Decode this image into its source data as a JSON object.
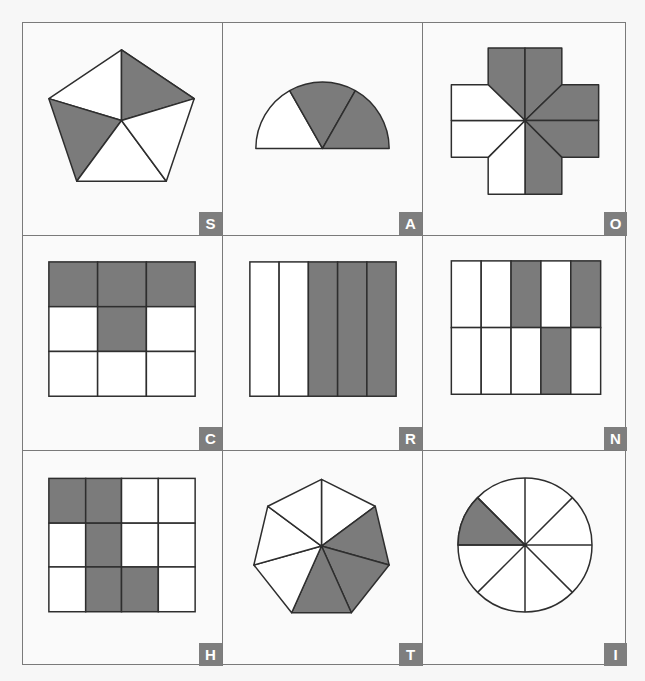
{
  "colors": {
    "shade": "#7b7b7b",
    "stroke": "#2e2e2e",
    "unshaded": "#ffffff",
    "badge_bg": "#7e7e7e",
    "badge_text": "#ffffff",
    "grid_line": "#7a7a7a"
  },
  "puzzle": {
    "cells": [
      {
        "label": "S",
        "shape": "pentagon",
        "divisions": 5,
        "shaded": 2,
        "shaded_parts": [
          "top-right",
          "left"
        ]
      },
      {
        "label": "A",
        "shape": "semicircle",
        "divisions": 3,
        "shaded": 2,
        "shaded_parts": [
          "middle",
          "right"
        ]
      },
      {
        "label": "O",
        "shape": "cross",
        "divisions": 8,
        "shaded": 5,
        "shaded_parts": [
          "top-left",
          "top-right",
          "right-upper",
          "right-lower",
          "bottom-right"
        ]
      },
      {
        "label": "C",
        "shape": "square-grid-3x3",
        "divisions": 9,
        "shaded": 4,
        "shaded_parts": [
          "r0c0",
          "r0c1",
          "r0c2",
          "r1c1"
        ]
      },
      {
        "label": "R",
        "shape": "square-strips-5",
        "divisions": 5,
        "shaded": 3,
        "shaded_parts": [
          "strip3",
          "strip4",
          "strip5"
        ]
      },
      {
        "label": "N",
        "shape": "rect-grid-2x5",
        "divisions": 10,
        "shaded": 3,
        "shaded_parts": [
          "r0c2",
          "r0c4",
          "r1c3"
        ]
      },
      {
        "label": "H",
        "shape": "rect-grid-3x4",
        "divisions": 12,
        "shaded": 5,
        "shaded_parts": [
          "r0c0",
          "r0c1",
          "r1c1",
          "r2c1",
          "r2c2"
        ]
      },
      {
        "label": "T",
        "shape": "heptagon",
        "divisions": 7,
        "shaded": 3,
        "shaded_parts": [
          "right-upper",
          "right-lower",
          "bottom"
        ]
      },
      {
        "label": "I",
        "shape": "circle",
        "divisions": 8,
        "shaded": 1,
        "shaded_parts": [
          "upper-left"
        ]
      }
    ]
  }
}
